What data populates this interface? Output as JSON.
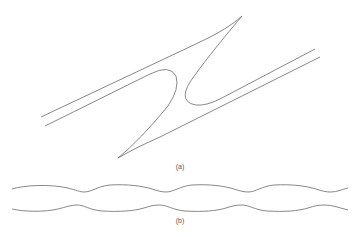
{
  "figure": {
    "panel_a": {
      "caption": "(a)",
      "description": "Two parallel strands joined by an S-shaped cusp structure (inclined lines with sharp tips)"
    },
    "panel_b": {
      "caption": "(b)",
      "description": "Two wavy horizontal lines with periodic undulations"
    },
    "stroke_color": "#7a7a7a",
    "background": "#ffffff"
  }
}
